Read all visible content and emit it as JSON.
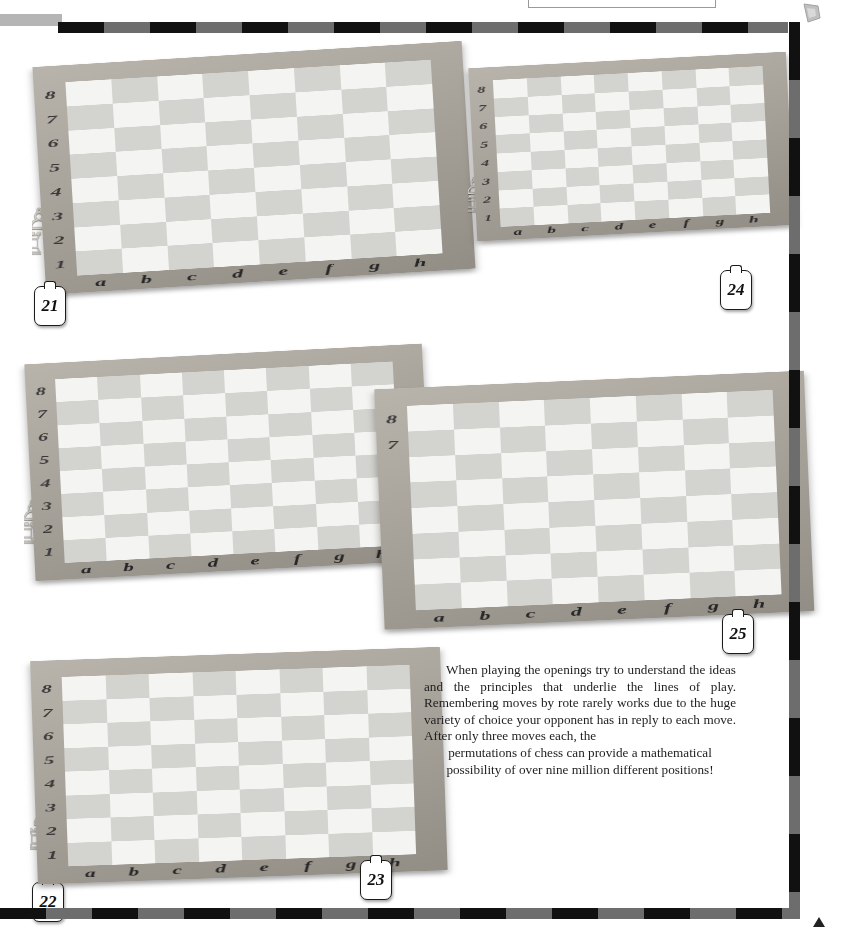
{
  "page": {
    "header_title": "OPENINGS",
    "background_color": "#ffffff",
    "border_colors": {
      "dark": "#111111",
      "light": "#6d6d6d"
    }
  },
  "article": {
    "paragraph": "When playing the openings try to understand the ideas and the principles that underlie the lines of play. Remembering moves by rote rarely works due to the huge variety of choice your opponent has in reply to each move. After only three moves each, the",
    "paragraph_last_line": "permutations of chess can provide a mathematical possibility of over nine million different positions!"
  },
  "boards": [
    {
      "number": "21",
      "files": [
        "a",
        "b",
        "c",
        "d",
        "e",
        "f",
        "g",
        "h"
      ],
      "ranks": [
        "8",
        "7",
        "6",
        "5",
        "4",
        "3",
        "2",
        "1"
      ],
      "pieces": [
        {
          "sq": "a8",
          "color": "black",
          "type": "rook"
        },
        {
          "sq": "c8",
          "color": "black",
          "type": "bishop"
        },
        {
          "sq": "e8",
          "color": "black",
          "type": "king"
        },
        {
          "sq": "f8",
          "color": "black",
          "type": "bishop"
        },
        {
          "sq": "h8",
          "color": "black",
          "type": "rook"
        },
        {
          "sq": "a7",
          "color": "black",
          "type": "pawn"
        },
        {
          "sq": "b7",
          "color": "black",
          "type": "queen"
        },
        {
          "sq": "d7",
          "color": "black",
          "type": "pawn"
        },
        {
          "sq": "g7",
          "color": "black",
          "type": "pawn"
        },
        {
          "sq": "h7",
          "color": "black",
          "type": "pawn"
        },
        {
          "sq": "b6",
          "color": "black",
          "type": "knight"
        },
        {
          "sq": "c6",
          "color": "black",
          "type": "knight"
        },
        {
          "sq": "e6",
          "color": "black",
          "type": "pawn"
        },
        {
          "sq": "f6",
          "color": "black",
          "type": "knight"
        },
        {
          "sq": "c4",
          "color": "white",
          "type": "bishop"
        },
        {
          "sq": "d4",
          "color": "white",
          "type": "knight"
        },
        {
          "sq": "g3",
          "color": "white",
          "type": "pawn"
        },
        {
          "sq": "a2",
          "color": "white",
          "type": "pawn"
        },
        {
          "sq": "b2",
          "color": "white",
          "type": "pawn"
        },
        {
          "sq": "e2",
          "color": "white",
          "type": "queen"
        },
        {
          "sq": "h2",
          "color": "white",
          "type": "pawn"
        },
        {
          "sq": "a1",
          "color": "white",
          "type": "rook"
        },
        {
          "sq": "c1",
          "color": "white",
          "type": "bishop"
        },
        {
          "sq": "d1",
          "color": "white",
          "type": "king"
        },
        {
          "sq": "f1",
          "color": "white",
          "type": "bishop"
        },
        {
          "sq": "h1",
          "color": "white",
          "type": "rook"
        }
      ]
    },
    {
      "number": "22",
      "files": [
        "a",
        "b",
        "c",
        "d",
        "e",
        "f",
        "g",
        "h"
      ],
      "ranks": [
        "8",
        "7",
        "6",
        "5",
        "4",
        "3",
        "2",
        "1"
      ],
      "pieces": [
        {
          "sq": "a8",
          "color": "black",
          "type": "rook"
        },
        {
          "sq": "c8",
          "color": "black",
          "type": "bishop"
        },
        {
          "sq": "e8",
          "color": "black",
          "type": "king"
        },
        {
          "sq": "f8",
          "color": "black",
          "type": "bishop"
        },
        {
          "sq": "h8",
          "color": "black",
          "type": "rook"
        },
        {
          "sq": "a7",
          "color": "black",
          "type": "pawn"
        },
        {
          "sq": "b7",
          "color": "black",
          "type": "queen"
        },
        {
          "sq": "d7",
          "color": "black",
          "type": "pawn"
        },
        {
          "sq": "f7",
          "color": "black",
          "type": "knight"
        },
        {
          "sq": "g7",
          "color": "black",
          "type": "pawn"
        },
        {
          "sq": "h7",
          "color": "black",
          "type": "pawn"
        },
        {
          "sq": "e6",
          "color": "black",
          "type": "knight"
        },
        {
          "sq": "b5",
          "color": "white",
          "type": "bishop"
        },
        {
          "sq": "c4",
          "color": "white",
          "type": "knight"
        },
        {
          "sq": "g3",
          "color": "white",
          "type": "pawn"
        },
        {
          "sq": "a2",
          "color": "white",
          "type": "pawn"
        },
        {
          "sq": "b2",
          "color": "white",
          "type": "pawn"
        },
        {
          "sq": "e2",
          "color": "white",
          "type": "queen"
        },
        {
          "sq": "h2",
          "color": "white",
          "type": "pawn"
        },
        {
          "sq": "a1",
          "color": "white",
          "type": "rook"
        },
        {
          "sq": "c1",
          "color": "white",
          "type": "bishop"
        },
        {
          "sq": "d1",
          "color": "white",
          "type": "king"
        },
        {
          "sq": "f1",
          "color": "white",
          "type": "bishop"
        },
        {
          "sq": "h1",
          "color": "white",
          "type": "rook"
        }
      ]
    },
    {
      "number": "23",
      "files": [
        "a",
        "b",
        "c",
        "d",
        "e",
        "f",
        "g",
        "h"
      ],
      "ranks": [
        "8",
        "7",
        "6",
        "5",
        "4",
        "3",
        "2",
        "1"
      ],
      "pieces": [
        {
          "sq": "a8",
          "color": "black",
          "type": "rook"
        },
        {
          "sq": "c8",
          "color": "black",
          "type": "bishop"
        },
        {
          "sq": "e8",
          "color": "black",
          "type": "king"
        },
        {
          "sq": "f8",
          "color": "black",
          "type": "bishop"
        },
        {
          "sq": "h8",
          "color": "black",
          "type": "rook"
        },
        {
          "sq": "b7",
          "color": "black",
          "type": "queen"
        },
        {
          "sq": "d7",
          "color": "black",
          "type": "pawn"
        },
        {
          "sq": "f7",
          "color": "black",
          "type": "knight"
        },
        {
          "sq": "g7",
          "color": "black",
          "type": "pawn"
        },
        {
          "sq": "h7",
          "color": "black",
          "type": "pawn"
        },
        {
          "sq": "a6",
          "color": "black",
          "type": "pawn"
        },
        {
          "sq": "e6",
          "color": "black",
          "type": "knight"
        },
        {
          "sq": "b5",
          "color": "white",
          "type": "bishop"
        },
        {
          "sq": "c4",
          "color": "white",
          "type": "knight"
        },
        {
          "sq": "g3",
          "color": "white",
          "type": "bishop"
        },
        {
          "sq": "a2",
          "color": "white",
          "type": "pawn"
        },
        {
          "sq": "b2",
          "color": "white",
          "type": "pawn"
        },
        {
          "sq": "e2",
          "color": "white",
          "type": "queen"
        },
        {
          "sq": "f2",
          "color": "white",
          "type": "pawn"
        },
        {
          "sq": "g2",
          "color": "white",
          "type": "pawn"
        },
        {
          "sq": "h2",
          "color": "white",
          "type": "pawn"
        },
        {
          "sq": "a1",
          "color": "white",
          "type": "rook"
        },
        {
          "sq": "c1",
          "color": "white",
          "type": "bishop"
        },
        {
          "sq": "d1",
          "color": "white",
          "type": "king"
        },
        {
          "sq": "h1",
          "color": "white",
          "type": "rook"
        }
      ]
    },
    {
      "number": "24",
      "files": [
        "a",
        "b",
        "c",
        "d",
        "e",
        "f",
        "g",
        "h"
      ],
      "ranks": [
        "8",
        "7",
        "6",
        "5",
        "4",
        "3",
        "2",
        "1"
      ],
      "pieces": [
        {
          "sq": "a8",
          "color": "black",
          "type": "rook"
        },
        {
          "sq": "c8",
          "color": "black",
          "type": "bishop"
        },
        {
          "sq": "e8",
          "color": "black",
          "type": "king"
        },
        {
          "sq": "f8",
          "color": "black",
          "type": "bishop"
        },
        {
          "sq": "h8",
          "color": "black",
          "type": "rook"
        },
        {
          "sq": "b7",
          "color": "black",
          "type": "queen"
        },
        {
          "sq": "d7",
          "color": "black",
          "type": "pawn"
        },
        {
          "sq": "f7",
          "color": "black",
          "type": "knight"
        },
        {
          "sq": "g7",
          "color": "black",
          "type": "pawn"
        },
        {
          "sq": "h7",
          "color": "black",
          "type": "pawn"
        },
        {
          "sq": "a6",
          "color": "black",
          "type": "pawn"
        },
        {
          "sq": "e6",
          "color": "black",
          "type": "pawn"
        },
        {
          "sq": "f6",
          "color": "black",
          "type": "knight"
        },
        {
          "sq": "g4",
          "color": "black",
          "type": "knight"
        },
        {
          "sq": "a5",
          "color": "white",
          "type": "bishop"
        },
        {
          "sq": "b6",
          "color": "white",
          "type": "knight"
        },
        {
          "sq": "c4",
          "color": "white",
          "type": "knight"
        },
        {
          "sq": "g3",
          "color": "white",
          "type": "pawn"
        },
        {
          "sq": "a2",
          "color": "white",
          "type": "pawn"
        },
        {
          "sq": "b2",
          "color": "white",
          "type": "pawn"
        },
        {
          "sq": "e2",
          "color": "white",
          "type": "queen"
        },
        {
          "sq": "f2",
          "color": "white",
          "type": "pawn"
        },
        {
          "sq": "g2",
          "color": "white",
          "type": "bishop"
        },
        {
          "sq": "h2",
          "color": "white",
          "type": "pawn"
        },
        {
          "sq": "a1",
          "color": "white",
          "type": "rook"
        },
        {
          "sq": "c1",
          "color": "white",
          "type": "bishop"
        },
        {
          "sq": "e1",
          "color": "white",
          "type": "king"
        },
        {
          "sq": "h1",
          "color": "white",
          "type": "rook"
        }
      ]
    },
    {
      "number": "25",
      "files": [
        "a",
        "b",
        "c",
        "d",
        "e",
        "f",
        "g",
        "h"
      ],
      "ranks": [
        "8",
        "7"
      ],
      "pieces": [
        {
          "sq": "b8",
          "color": "black",
          "type": "knight"
        },
        {
          "sq": "c8",
          "color": "white",
          "type": "bishop"
        },
        {
          "sq": "d8",
          "color": "black",
          "type": "bishop"
        },
        {
          "sq": "e8",
          "color": "black",
          "type": "king"
        },
        {
          "sq": "f8",
          "color": "white",
          "type": "knight"
        },
        {
          "sq": "g8",
          "color": "white",
          "type": "knight"
        },
        {
          "sq": "b7",
          "color": "black",
          "type": "queen"
        },
        {
          "sq": "f7",
          "color": "black",
          "type": "bishop"
        },
        {
          "sq": "g7",
          "color": "black",
          "type": "pawn"
        },
        {
          "sq": "h7",
          "color": "black",
          "type": "rook"
        },
        {
          "sq": "d6",
          "color": "black",
          "type": "pawn"
        },
        {
          "sq": "e6",
          "color": "black",
          "type": "knight"
        },
        {
          "sq": "f6",
          "color": "black",
          "type": "pawn"
        },
        {
          "sq": "c7",
          "color": "white",
          "type": "pawn"
        },
        {
          "sq": "b6",
          "color": "white",
          "type": "pawn"
        },
        {
          "sq": "c2",
          "color": "white",
          "type": "queen"
        },
        {
          "sq": "e2",
          "color": "white",
          "type": "pawn"
        },
        {
          "sq": "f2",
          "color": "white",
          "type": "pawn"
        },
        {
          "sq": "g3",
          "color": "white",
          "type": "pawn"
        },
        {
          "sq": "g2",
          "color": "white",
          "type": "bishop"
        },
        {
          "sq": "g1",
          "color": "white",
          "type": "king"
        },
        {
          "sq": "h2",
          "color": "white",
          "type": "pawn"
        }
      ]
    }
  ]
}
